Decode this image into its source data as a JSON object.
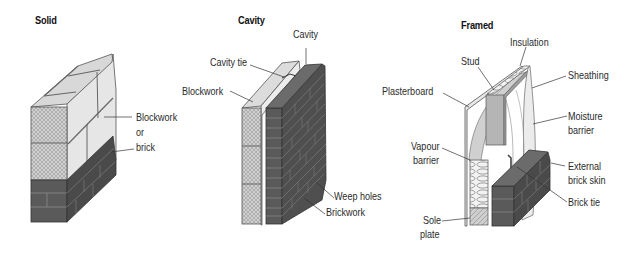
{
  "diagrams": [
    {
      "title": "Solid",
      "labels": {
        "material_line1": "Blockwork",
        "material_line2": "or",
        "material_line3": "brick"
      }
    },
    {
      "title": "Cavity",
      "labels": {
        "cavity": "Cavity",
        "cavity_tie": "Cavity tie",
        "blockwork": "Blockwork",
        "weep_holes": "Weep holes",
        "brickwork": "Brickwork"
      }
    },
    {
      "title": "Framed",
      "labels": {
        "insulation": "Insulation",
        "stud": "Stud",
        "plasterboard": "Plasterboard",
        "sheathing": "Sheathing",
        "moisture_barrier_1": "Moisture",
        "moisture_barrier_2": "barrier",
        "vapour_barrier_1": "Vapour",
        "vapour_barrier_2": "barrier",
        "external_brick_skin_1": "External",
        "external_brick_skin_2": "brick skin",
        "brick_tie": "Brick tie",
        "sole_plate_1": "Sole",
        "sole_plate_2": "plate"
      }
    }
  ],
  "colors": {
    "brick_front": "#5a5a5a",
    "brick_side": "#4a4a4a",
    "brick_top": "#6b6b6b",
    "mortar": "#8a8a8a",
    "block_light": "#e4e4e4",
    "block_top": "#d6d6d6",
    "block_hatch": "#b8b8b8",
    "leader_line": "#333333"
  }
}
